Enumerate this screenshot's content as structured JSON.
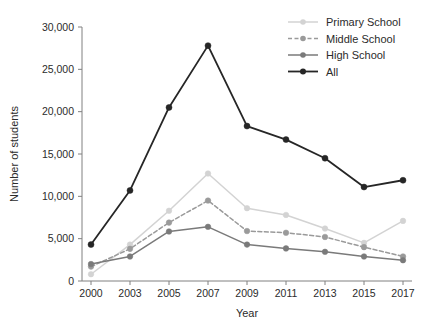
{
  "chart_data": {
    "type": "line",
    "title": "",
    "xlabel": "Year",
    "ylabel": "Number of students",
    "categories": [
      "2000",
      "2003",
      "2005",
      "2007",
      "2009",
      "2011",
      "2013",
      "2015",
      "2017"
    ],
    "x": [
      2000,
      2003,
      2005,
      2007,
      2009,
      2011,
      2013,
      2015,
      2017
    ],
    "ylim": [
      0,
      30000
    ],
    "yticks": [
      0,
      5000,
      10000,
      15000,
      20000,
      25000,
      30000
    ],
    "ytick_labels": [
      "0",
      "5,000",
      "10,000",
      "15,000",
      "20,000",
      "25,000",
      "30,000"
    ],
    "grid": false,
    "legend_position": "top-right",
    "series": [
      {
        "name": "Primary School",
        "color": "#d3d3d3",
        "dash": "solid",
        "marker": "circle",
        "values": [
          800,
          4300,
          8300,
          12700,
          8600,
          7800,
          6200,
          4500,
          7100
        ]
      },
      {
        "name": "Middle School",
        "color": "#9a9a9a",
        "dash": "dashed",
        "marker": "circle",
        "values": [
          1700,
          3800,
          6900,
          9500,
          5900,
          5700,
          5200,
          4000,
          2900
        ]
      },
      {
        "name": "High School",
        "color": "#7a7a7a",
        "dash": "solid",
        "marker": "circle",
        "values": [
          2000,
          2900,
          5850,
          6400,
          4300,
          3850,
          3450,
          2900,
          2450
        ]
      },
      {
        "name": "All",
        "color": "#262626",
        "dash": "solid",
        "marker": "circle",
        "values": [
          4300,
          10700,
          20500,
          27800,
          18300,
          16700,
          14500,
          11100,
          11900
        ]
      }
    ]
  },
  "legend": {
    "items": [
      {
        "label": "Primary School"
      },
      {
        "label": "Middle School"
      },
      {
        "label": "High School"
      },
      {
        "label": "All"
      }
    ]
  },
  "axes": {
    "x_title": "Year",
    "y_title": "Number of students"
  }
}
